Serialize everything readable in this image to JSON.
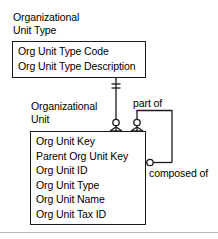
{
  "diagram": {
    "type": "entity-relationship-diagram",
    "notation": "crows-foot",
    "entities": [
      {
        "name": "Organizational\nUnit Type",
        "attributes": [
          "Org Unit Type Code",
          "Org Unit Type Description"
        ]
      },
      {
        "name": "Organizational\nUnit",
        "attributes": [
          "Org Unit Key",
          "Parent Org Unit Key",
          "Org Unit ID",
          "Org Unit Type",
          "Org Unit Name",
          "Org Unit Tax ID"
        ]
      }
    ],
    "relationships": [
      {
        "label": "part of"
      },
      {
        "label": "composed of"
      }
    ]
  },
  "colors": {
    "line": "#1a1a1a",
    "text": "#000000",
    "background": "#ffffff",
    "rule": "#b8b8b8"
  }
}
